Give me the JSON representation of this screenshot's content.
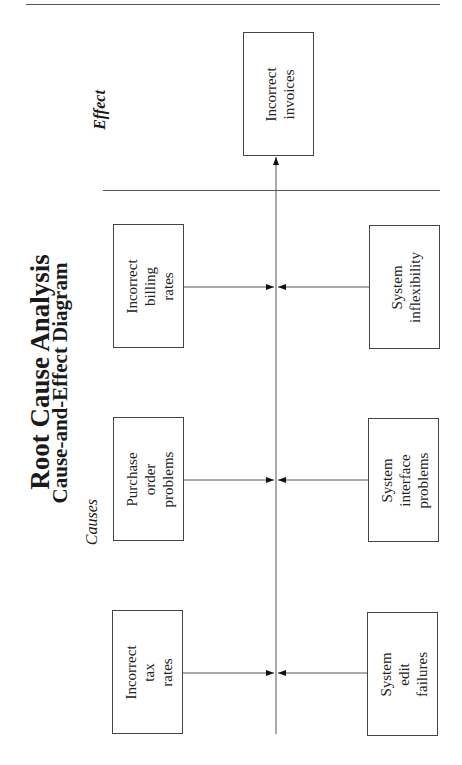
{
  "title": "Root Cause Analysis",
  "subtitle": "Cause-and-Effect Diagram",
  "labels": {
    "causes": "Causes",
    "effect": "Effect"
  },
  "effect": {
    "lines": [
      "Incorrect",
      "invoices"
    ]
  },
  "causes_top": [
    {
      "lines": [
        "Incorrect",
        "billing",
        "rates"
      ]
    },
    {
      "lines": [
        "Purchase",
        "order",
        "problems"
      ]
    },
    {
      "lines": [
        "Incorrect",
        "tax",
        "rates"
      ]
    }
  ],
  "causes_bottom": [
    {
      "lines": [
        "System",
        "inflexibility"
      ]
    },
    {
      "lines": [
        "System",
        "interface",
        "problems"
      ]
    },
    {
      "lines": [
        "System",
        "edit",
        "failures"
      ]
    }
  ],
  "text": {
    "effect_line1": "Incorrect",
    "effect_line2": "invoices",
    "c1_l1": "Incorrect",
    "c1_l2": "billing",
    "c1_l3": "rates",
    "c2_l1": "Purchase",
    "c2_l2": "order",
    "c2_l3": "problems",
    "c3_l1": "Incorrect",
    "c3_l2": "tax",
    "c3_l3": "rates",
    "c4_l1": "System",
    "c4_l2": "inflexibility",
    "c5_l1": "System",
    "c5_l2": "interface",
    "c5_l3": "problems",
    "c6_l1": "System",
    "c6_l2": "edit",
    "c6_l3": "failures"
  }
}
